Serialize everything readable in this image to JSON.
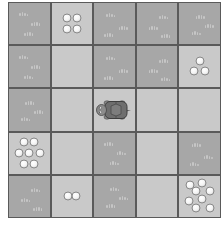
{
  "game": {
    "grid_size": {
      "rows": 5,
      "cols": 5
    },
    "colors": {
      "grass": "#a7a7a7",
      "light": "#c9c9c9",
      "grid_line": "#5a5a5a",
      "pebble": "#f4f4f4",
      "turtle_shell": "#6e6e6e",
      "turtle_skin": "#8c8c8c"
    },
    "player": {
      "type": "turtle",
      "row": 2,
      "col": 2,
      "facing": "left"
    },
    "cells": [
      [
        {
          "type": "grass",
          "pebbles": 0
        },
        {
          "type": "light",
          "pebbles": 4
        },
        {
          "type": "grass",
          "pebbles": 0
        },
        {
          "type": "grass",
          "pebbles": 0
        },
        {
          "type": "grass",
          "pebbles": 0
        }
      ],
      [
        {
          "type": "grass",
          "pebbles": 0
        },
        {
          "type": "light",
          "pebbles": 0
        },
        {
          "type": "grass",
          "pebbles": 0
        },
        {
          "type": "grass",
          "pebbles": 0
        },
        {
          "type": "light",
          "pebbles": 3
        }
      ],
      [
        {
          "type": "grass",
          "pebbles": 0
        },
        {
          "type": "light",
          "pebbles": 0
        },
        {
          "type": "light",
          "pebbles": 0
        },
        {
          "type": "light",
          "pebbles": 0
        },
        {
          "type": "light",
          "pebbles": 0
        }
      ],
      [
        {
          "type": "light",
          "pebbles": 7
        },
        {
          "type": "light",
          "pebbles": 0
        },
        {
          "type": "grass",
          "pebbles": 0
        },
        {
          "type": "light",
          "pebbles": 0
        },
        {
          "type": "grass",
          "pebbles": 0
        }
      ],
      [
        {
          "type": "grass",
          "pebbles": 0
        },
        {
          "type": "light",
          "pebbles": 2
        },
        {
          "type": "grass",
          "pebbles": 0
        },
        {
          "type": "light",
          "pebbles": 0
        },
        {
          "type": "light",
          "pebbles": 8
        }
      ]
    ]
  }
}
